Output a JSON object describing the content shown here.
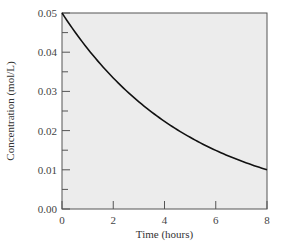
{
  "chart_data": {
    "type": "line",
    "title": "",
    "xlabel": "Time (hours)",
    "ylabel": "Concentration (mol/L)",
    "xlim": [
      0,
      8
    ],
    "ylim": [
      0,
      0.05
    ],
    "x_ticks": [
      0,
      2,
      4,
      6,
      8
    ],
    "x_tick_labels": [
      "0",
      "2",
      "4",
      "6",
      "8"
    ],
    "y_ticks": [
      0.0,
      0.01,
      0.02,
      0.03,
      0.04,
      0.05
    ],
    "y_tick_labels": [
      "0.00",
      "0.01",
      "0.02",
      "0.03",
      "0.04",
      "0.05"
    ],
    "y_minor_ticks": [
      0.005,
      0.015,
      0.025,
      0.035,
      0.045
    ],
    "x_minor_ticks": [],
    "grid": false,
    "legend": null,
    "series": [
      {
        "name": "concentration",
        "x": [
          0,
          1,
          2,
          3,
          4,
          5,
          6,
          7,
          8
        ],
        "values": [
          0.05,
          0.041,
          0.033,
          0.027,
          0.022,
          0.018,
          0.015,
          0.012,
          0.01
        ]
      }
    ],
    "colors": {
      "plot_background": "#ececec",
      "line": "#111111",
      "axis": "#555555"
    }
  }
}
